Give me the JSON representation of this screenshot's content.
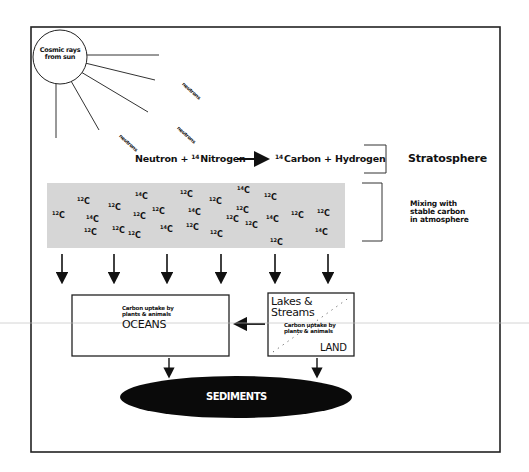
{
  "diagram": {
    "sun": {
      "label": "Cosmic rays from sun",
      "lines": [
        "Cosmic rays",
        "from sun"
      ]
    },
    "neutron_labels": [
      {
        "text": "neutrons",
        "x": 183,
        "y": 83
      },
      {
        "text": "neutrons",
        "x": 120,
        "y": 135
      },
      {
        "text": "neutrons",
        "x": 178,
        "y": 127
      }
    ],
    "reaction": {
      "reactant1": "Neutron",
      "plus1": "+",
      "reactant2_mass": "14",
      "reactant2": "Nitrogen",
      "product1_mass": "14",
      "product1": "Carbon",
      "plus2": "+",
      "product2": "Hydrogen"
    },
    "layers": {
      "stratosphere": "Stratosphere",
      "mixing": [
        "Mixing with",
        "stable carbon",
        "in atmosphere"
      ]
    },
    "atmosphere_isotopes": [
      {
        "mass": "12",
        "x": 52,
        "y": 210
      },
      {
        "mass": "12",
        "x": 77,
        "y": 196
      },
      {
        "mass": "14",
        "x": 86,
        "y": 214
      },
      {
        "mass": "12",
        "x": 84,
        "y": 227
      },
      {
        "mass": "12",
        "x": 108,
        "y": 202
      },
      {
        "mass": "12",
        "x": 112,
        "y": 225
      },
      {
        "mass": "14",
        "x": 135,
        "y": 191
      },
      {
        "mass": "12",
        "x": 128,
        "y": 230
      },
      {
        "mass": "12",
        "x": 133,
        "y": 211
      },
      {
        "mass": "12",
        "x": 152,
        "y": 206
      },
      {
        "mass": "14",
        "x": 160,
        "y": 224
      },
      {
        "mass": "12",
        "x": 180,
        "y": 189
      },
      {
        "mass": "14",
        "x": 188,
        "y": 207
      },
      {
        "mass": "12",
        "x": 186,
        "y": 222
      },
      {
        "mass": "12",
        "x": 209,
        "y": 196
      },
      {
        "mass": "12",
        "x": 210,
        "y": 229
      },
      {
        "mass": "14",
        "x": 237,
        "y": 185
      },
      {
        "mass": "12",
        "x": 236,
        "y": 205
      },
      {
        "mass": "12",
        "x": 226,
        "y": 214
      },
      {
        "mass": "12",
        "x": 245,
        "y": 220
      },
      {
        "mass": "12",
        "x": 264,
        "y": 192
      },
      {
        "mass": "14",
        "x": 266,
        "y": 214
      },
      {
        "mass": "12",
        "x": 291,
        "y": 210
      },
      {
        "mass": "12",
        "x": 270,
        "y": 237
      },
      {
        "mass": "12",
        "x": 317,
        "y": 208
      },
      {
        "mass": "14",
        "x": 315,
        "y": 227
      }
    ],
    "isotope_symbol": "C",
    "oceans": {
      "uptake": [
        "Carbon uptake by",
        "plants & animals"
      ],
      "label": "OCEANS"
    },
    "land": {
      "lakes": [
        "Lakes &",
        "Streams"
      ],
      "uptake": [
        "Carbon uptake by",
        "plants & animals"
      ],
      "label": "LAND"
    },
    "sediments": {
      "label": "SEDIMENTS"
    },
    "colors": {
      "band": "#d6d6d6",
      "line": "#1a1a1a",
      "ellipse": "#0a0a0a",
      "scan_line": "#bdbdbd"
    }
  }
}
